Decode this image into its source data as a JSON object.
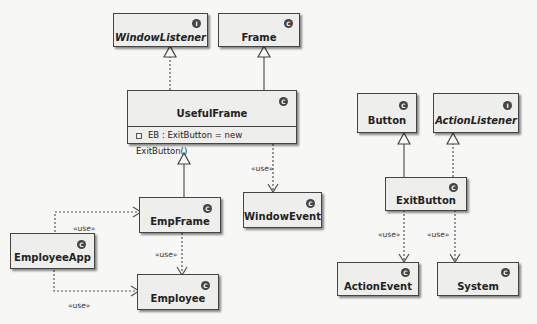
{
  "diagram": {
    "type": "uml-class-diagram",
    "classes": [
      {
        "id": "WindowListener",
        "name": "WindowListener",
        "stereotype": "I",
        "italic": true
      },
      {
        "id": "Frame",
        "name": "Frame",
        "stereotype": "C"
      },
      {
        "id": "UsefulFrame",
        "name": "UsefulFrame",
        "stereotype": "C",
        "attributes": [
          "EB : ExitButton = new ExitButton()"
        ]
      },
      {
        "id": "EmpFrame",
        "name": "EmpFrame",
        "stereotype": "C"
      },
      {
        "id": "WindowEvent",
        "name": "WindowEvent",
        "stereotype": "C"
      },
      {
        "id": "EmployeeApp",
        "name": "EmployeeApp",
        "stereotype": "C"
      },
      {
        "id": "Employee",
        "name": "Employee",
        "stereotype": "C"
      },
      {
        "id": "Button",
        "name": "Button",
        "stereotype": "C"
      },
      {
        "id": "ActionListener",
        "name": "ActionListener",
        "stereotype": "I",
        "italic": true
      },
      {
        "id": "ExitButton",
        "name": "ExitButton",
        "stereotype": "C"
      },
      {
        "id": "ActionEvent",
        "name": "ActionEvent",
        "stereotype": "C"
      },
      {
        "id": "System",
        "name": "System",
        "stereotype": "C"
      }
    ],
    "relations": [
      {
        "from": "UsefulFrame",
        "to": "WindowListener",
        "kind": "realization"
      },
      {
        "from": "UsefulFrame",
        "to": "Frame",
        "kind": "generalization"
      },
      {
        "from": "UsefulFrame",
        "to": "WindowEvent",
        "kind": "dependency",
        "label": "«use»"
      },
      {
        "from": "EmpFrame",
        "to": "UsefulFrame",
        "kind": "generalization"
      },
      {
        "from": "EmployeeApp",
        "to": "EmpFrame",
        "kind": "dependency",
        "label": "«use»"
      },
      {
        "from": "EmployeeApp",
        "to": "Employee",
        "kind": "dependency",
        "label": "«use»"
      },
      {
        "from": "EmpFrame",
        "to": "Employee",
        "kind": "dependency",
        "label": "«use»"
      },
      {
        "from": "ExitButton",
        "to": "Button",
        "kind": "generalization"
      },
      {
        "from": "ExitButton",
        "to": "ActionListener",
        "kind": "realization"
      },
      {
        "from": "ExitButton",
        "to": "ActionEvent",
        "kind": "dependency",
        "label": "«use»"
      },
      {
        "from": "ExitButton",
        "to": "System",
        "kind": "dependency",
        "label": "«use»"
      }
    ]
  },
  "labels": {
    "use": "«use»"
  }
}
